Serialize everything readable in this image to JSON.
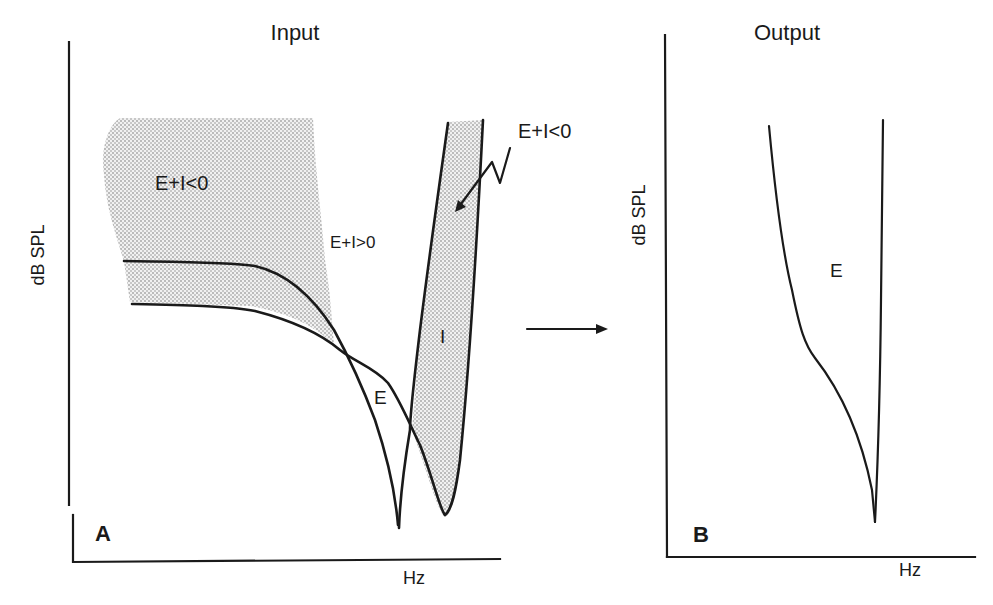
{
  "figure": {
    "panels": [
      {
        "id": "A",
        "title": "Input",
        "panel_label": "A",
        "x_axis_label": "Hz",
        "y_axis_label": "dB SPL",
        "curve_labels": {
          "excitatory": "E",
          "inhibitory": "I"
        },
        "region_labels": {
          "left_shaded": "E+I<0",
          "middle_unshaded": "E+I>0",
          "right_shaded_callout": "E+I<0"
        }
      },
      {
        "id": "B",
        "title": "Output",
        "panel_label": "B",
        "x_axis_label": "Hz",
        "y_axis_label": "dB SPL",
        "curve_labels": {
          "excitatory": "E"
        }
      }
    ],
    "arrow_meaning": "input-to-output transformation",
    "colors": {
      "ink": "#1a1a1a",
      "shade_dots": "#6b6b6b",
      "background": "#ffffff"
    }
  }
}
